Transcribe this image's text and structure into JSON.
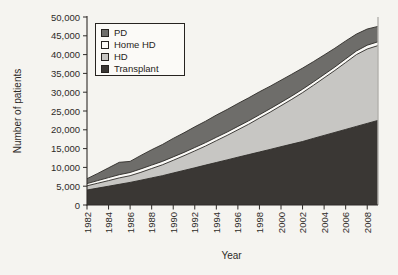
{
  "figure": {
    "background": "#f5f4f0",
    "axis_color": "#2e2b28",
    "right_frame_color": "#b3b1ad"
  },
  "chart_data": {
    "type": "area",
    "stacked": true,
    "title": "",
    "xlabel": "Year",
    "ylabel": "Number of patients",
    "ylim": [
      0,
      50000
    ],
    "grid": false,
    "x": [
      1982,
      1983,
      1984,
      1985,
      1986,
      1987,
      1988,
      1989,
      1990,
      1991,
      1992,
      1993,
      1994,
      1995,
      1996,
      1997,
      1998,
      1999,
      2000,
      2001,
      2002,
      2003,
      2004,
      2005,
      2006,
      2007,
      2008,
      2009
    ],
    "series": [
      {
        "name": "Transplant",
        "color": "#3a3734",
        "values": [
          4000,
          4500,
          5000,
          5500,
          6000,
          6600,
          7200,
          7800,
          8500,
          9200,
          9900,
          10600,
          11300,
          12000,
          12700,
          13400,
          14100,
          14800,
          15500,
          16200,
          16900,
          17700,
          18500,
          19300,
          20100,
          20900,
          21700,
          22500
        ]
      },
      {
        "name": "HD",
        "color": "#c7c6c3",
        "values": [
          1100,
          1300,
          1500,
          1700,
          1800,
          2100,
          2500,
          2900,
          3400,
          3900,
          4500,
          5100,
          5800,
          6500,
          7300,
          8100,
          9000,
          9900,
          10900,
          11900,
          13000,
          14100,
          15300,
          16500,
          17800,
          19100,
          19800,
          19900
        ]
      },
      {
        "name": "Home HD",
        "color": "#fbfaf7",
        "values": [
          600,
          700,
          800,
          850,
          850,
          900,
          900,
          900,
          900,
          900,
          900,
          900,
          900,
          900,
          900,
          900,
          900,
          900,
          900,
          900,
          900,
          900,
          900,
          900,
          950,
          950,
          1000,
          1000
        ]
      },
      {
        "name": "PD",
        "color": "#6e6d6a",
        "values": [
          1300,
          1900,
          2600,
          3300,
          2950,
          3600,
          4100,
          4500,
          4900,
          5200,
          5500,
          5700,
          5900,
          6000,
          6100,
          6100,
          6100,
          6000,
          5900,
          5800,
          5600,
          5400,
          5200,
          5000,
          4800,
          4500,
          4300,
          4100
        ]
      }
    ],
    "yticks": [
      "0",
      "5,000",
      "10,000",
      "15,000",
      "20,000",
      "25,000",
      "30,000",
      "35,000",
      "40,000",
      "45,000",
      "50,000"
    ],
    "xticks": [
      "1982",
      "1984",
      "1986",
      "1988",
      "1990",
      "1992",
      "1994",
      "1996",
      "1998",
      "2000",
      "2002",
      "2004",
      "2006",
      "2008"
    ],
    "legend": {
      "position": "top-left-inside",
      "order": [
        "PD",
        "Home HD",
        "HD",
        "Transplant"
      ]
    }
  }
}
